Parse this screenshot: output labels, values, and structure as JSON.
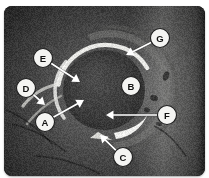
{
  "figure": {
    "modality": "MRI",
    "view": "axial oblique",
    "plate_background": "#1b1b1b",
    "marker_fill": "#f4f4f2",
    "marker_stroke": "#1d1d1d",
    "leader_color": "#ffffff"
  },
  "markers": [
    {
      "id": "A",
      "label": "A",
      "cx": 45,
      "cy": 122,
      "r": 9.5,
      "tip_x": 84,
      "tip_y": 100,
      "structure": "anterior labrum"
    },
    {
      "id": "B",
      "label": "B",
      "cx": 131,
      "cy": 86,
      "r": 9.5,
      "tip_x": null,
      "tip_y": null,
      "structure": "femoral head"
    },
    {
      "id": "C",
      "label": "C",
      "cx": 123,
      "cy": 157,
      "r": 9.5,
      "tip_x": 100,
      "tip_y": 135,
      "structure": "soft tissue / muscle"
    },
    {
      "id": "D",
      "label": "D",
      "cx": 26,
      "cy": 88,
      "r": 9.5,
      "tip_x": 45,
      "tip_y": 105,
      "structure": "joint capsule"
    },
    {
      "id": "E",
      "label": "E",
      "cx": 43,
      "cy": 58,
      "r": 9.5,
      "tip_x": 80,
      "tip_y": 82,
      "structure": "labral tear"
    },
    {
      "id": "F",
      "label": "F",
      "cx": 167,
      "cy": 115,
      "r": 9.5,
      "tip_x": 106,
      "tip_y": 115,
      "structure": "posterior labrum"
    },
    {
      "id": "G",
      "label": "G",
      "cx": 160,
      "cy": 38,
      "r": 9.5,
      "tip_x": 126,
      "tip_y": 55,
      "structure": "acetabular rim"
    }
  ],
  "anatomy": {
    "femoral_head": {
      "cx": 104,
      "cy": 90,
      "rx": 41,
      "ry": 40,
      "tone": "#3a3a3a"
    },
    "bright_arcs": [
      {
        "name": "superior-labrum-arc",
        "tone": "#e8e8e4"
      },
      {
        "name": "anterior-labrum-arc",
        "tone": "#dcdcd8"
      },
      {
        "name": "posterior-labrum-arc",
        "tone": "#ededea"
      }
    ],
    "background_tissue_tone": "#4a4a4a"
  }
}
